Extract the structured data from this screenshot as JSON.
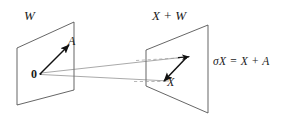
{
  "figure": {
    "background_color": "#ffffff",
    "stroke_color": "#3a3a3a",
    "vector_color": "#111111",
    "dashed_color": "#8a8a8a",
    "width": 286,
    "height": 130
  },
  "labels": {
    "left_plane": "W",
    "right_plane": "X + W",
    "vector_a": "A",
    "origin": "0",
    "vector_x": "X",
    "equation_sigma": "σX",
    "equation_eq": " = ",
    "equation_rhs": "X + A",
    "equation_full": "σX = X + A"
  },
  "geometry": {
    "left_plane": {
      "name": "W",
      "corners": [
        [
          17,
          48
        ],
        [
          74,
          22
        ],
        [
          74,
          90
        ],
        [
          17,
          105
        ]
      ]
    },
    "right_plane": {
      "name": "X + W",
      "corners": [
        [
          146,
          50
        ],
        [
          208,
          25
        ],
        [
          208,
          113
        ],
        [
          146,
          86
        ]
      ]
    },
    "vector_a": {
      "from": [
        40,
        74
      ],
      "to": [
        70,
        44
      ],
      "label": "A"
    },
    "vector_x": {
      "from": [
        185,
        60
      ],
      "to": [
        163,
        82
      ],
      "label": "X"
    },
    "connector_upper": {
      "from": [
        41,
        73
      ],
      "to": [
        189,
        57
      ]
    },
    "connector_lower": {
      "from": [
        41,
        74
      ],
      "to": [
        168,
        81
      ]
    },
    "dashed_upper": {
      "from": [
        140,
        60
      ],
      "to": [
        185,
        57
      ]
    },
    "dashed_lower": {
      "from": [
        138,
        81
      ],
      "to": [
        165,
        81
      ]
    }
  }
}
